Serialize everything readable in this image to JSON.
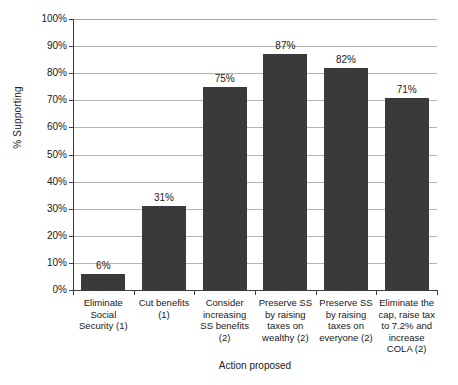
{
  "chart_data": {
    "type": "bar",
    "title": "",
    "xlabel": "Action proposed",
    "ylabel": "% Supporting",
    "ylim": [
      0,
      100
    ],
    "grid": true,
    "legend": "none",
    "orientation": "vertical",
    "bar_color": "#3a3a3a",
    "gridline_color": "#b4b4b4",
    "axis_color": "#3d3d3d",
    "categories": [
      "Eliminate Social Security (1)",
      "Cut benefits (1)",
      "Consider increasing SS benefits (2)",
      "Preserve SS by raising taxes on wealthy (2)",
      "Preserve SS by raising taxes on everyone (2)",
      "Eliminate the cap, raise tax to 7.2% and increase COLA (2)"
    ],
    "category_lines": [
      [
        "Eliminate",
        "Social",
        "Security (1)"
      ],
      [
        "Cut benefits",
        "(1)"
      ],
      [
        "Consider",
        "increasing",
        "SS benefits (2)"
      ],
      [
        "Preserve SS",
        "by raising",
        "taxes on",
        "wealthy (2)"
      ],
      [
        "Preserve SS",
        "by raising",
        "taxes on",
        "everyone (2)"
      ],
      [
        "Eliminate the",
        "cap, raise tax",
        "to 7.2% and",
        "increase",
        "COLA (2)"
      ]
    ],
    "values": [
      6,
      31,
      75,
      87,
      82,
      71
    ],
    "value_labels": [
      "6%",
      "31%",
      "75%",
      "87%",
      "82%",
      "71%"
    ],
    "ytick_values": [
      100,
      90,
      80,
      70,
      60,
      50,
      40,
      30,
      20,
      10,
      0
    ],
    "ytick_labels": [
      "100%",
      "90%",
      "80%",
      "70%",
      "60%",
      "50%",
      "40%",
      "30%",
      "20%",
      "10%",
      "0%"
    ]
  }
}
